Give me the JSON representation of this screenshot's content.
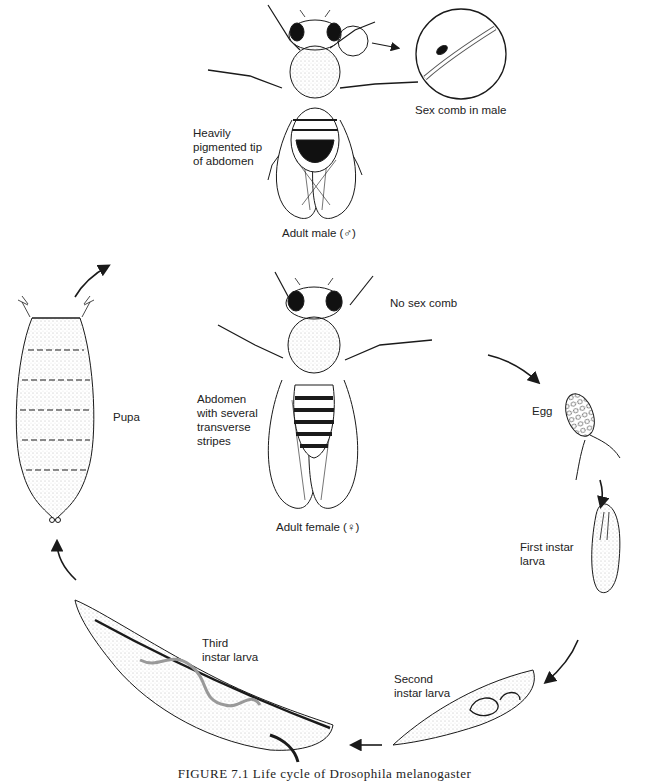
{
  "figure": {
    "caption": "FIGURE 7.1 Life cycle of Drosophila melanogaster",
    "stages": [
      {
        "id": "adult-male",
        "label": "Adult male (♂)"
      },
      {
        "id": "adult-female",
        "label": "Adult female (♀)"
      },
      {
        "id": "egg",
        "label": "Egg"
      },
      {
        "id": "first-instar",
        "label": "First instar\nlarva"
      },
      {
        "id": "second-instar",
        "label": "Second\ninstar larva"
      },
      {
        "id": "third-instar",
        "label": "Third\ninstar larva"
      },
      {
        "id": "pupa",
        "label": "Pupa"
      }
    ],
    "annotations": {
      "male_abdomen": "Heavily\npigmented tip\nof abdomen",
      "sex_comb": "Sex comb in male",
      "no_sex_comb": "No sex comb",
      "female_abdomen": "Abdomen\nwith several\ntransverse\nstripes"
    },
    "colors": {
      "ink": "#1a1a1a",
      "paper": "#ffffff",
      "stipple": "#9a9a9a"
    }
  }
}
